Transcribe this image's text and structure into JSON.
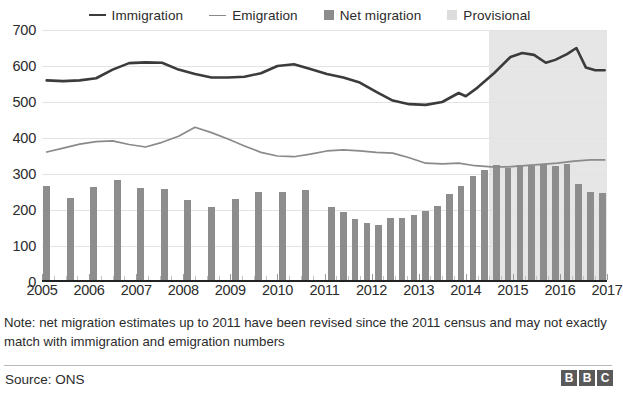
{
  "legend": {
    "items": [
      {
        "label": "Immigration",
        "marker": "line",
        "color": "#3b3b3b",
        "icon": "line-swatch-icon"
      },
      {
        "label": "Emigration",
        "marker": "line",
        "color": "#8a8a8a",
        "icon": "line-swatch-icon"
      },
      {
        "label": "Net migration",
        "marker": "square",
        "color": "#8c8c8c",
        "icon": "square-swatch-icon"
      },
      {
        "label": "Provisional",
        "marker": "square",
        "color": "#dcdcdc",
        "icon": "square-swatch-icon"
      }
    ]
  },
  "note": "Note: net migration estimates up to 2011 have been revised since the 2011 census and may not exactly match with immigration and emigration numbers",
  "footer": {
    "source": "Source: ONS",
    "brand_letters": [
      "B",
      "B",
      "C"
    ]
  },
  "chart_data": {
    "type": "bar",
    "title": "",
    "subtitle": "",
    "xlabel": "",
    "ylabel": "",
    "ylim": [
      0,
      700
    ],
    "yticks": [
      0,
      100,
      200,
      300,
      400,
      500,
      600,
      700
    ],
    "xlim": [
      2005.0,
      2017.0
    ],
    "xticks": [
      2005,
      2006,
      2007,
      2008,
      2009,
      2010,
      2011,
      2012,
      2013,
      2014,
      2015,
      2016,
      2017
    ],
    "grid": true,
    "legend_position": "top-center",
    "units": "thousands",
    "provisional_from": 2014.5,
    "annotations": [
      {
        "text": "Provisional shading begins mid-2014",
        "x": 2014.5
      }
    ],
    "series": [
      {
        "name": "Net migration",
        "type": "bar",
        "color": "#8d8d8d",
        "points": [
          {
            "x": 2005.1,
            "y": 268
          },
          {
            "x": 2005.6,
            "y": 233
          },
          {
            "x": 2006.1,
            "y": 265
          },
          {
            "x": 2006.6,
            "y": 283
          },
          {
            "x": 2007.1,
            "y": 262
          },
          {
            "x": 2007.6,
            "y": 258
          },
          {
            "x": 2008.1,
            "y": 229
          },
          {
            "x": 2008.6,
            "y": 207
          },
          {
            "x": 2009.1,
            "y": 230
          },
          {
            "x": 2009.6,
            "y": 249
          },
          {
            "x": 2010.1,
            "y": 251
          },
          {
            "x": 2010.6,
            "y": 256
          },
          {
            "x": 2011.15,
            "y": 209
          },
          {
            "x": 2011.4,
            "y": 195
          },
          {
            "x": 2011.65,
            "y": 174
          },
          {
            "x": 2011.9,
            "y": 165
          },
          {
            "x": 2012.15,
            "y": 157
          },
          {
            "x": 2012.4,
            "y": 179
          },
          {
            "x": 2012.65,
            "y": 177
          },
          {
            "x": 2012.9,
            "y": 187
          },
          {
            "x": 2013.15,
            "y": 198
          },
          {
            "x": 2013.4,
            "y": 211
          },
          {
            "x": 2013.65,
            "y": 244
          },
          {
            "x": 2013.9,
            "y": 268
          },
          {
            "x": 2014.15,
            "y": 294
          },
          {
            "x": 2014.4,
            "y": 311
          },
          {
            "x": 2014.65,
            "y": 326
          },
          {
            "x": 2014.9,
            "y": 318
          },
          {
            "x": 2015.15,
            "y": 324
          },
          {
            "x": 2015.4,
            "y": 323
          },
          {
            "x": 2015.65,
            "y": 329
          },
          {
            "x": 2015.9,
            "y": 323
          },
          {
            "x": 2016.15,
            "y": 327
          },
          {
            "x": 2016.4,
            "y": 273
          },
          {
            "x": 2016.65,
            "y": 250
          },
          {
            "x": 2016.9,
            "y": 248
          }
        ]
      },
      {
        "name": "Immigration",
        "type": "line",
        "color": "#3b3b3b",
        "points": [
          {
            "x": 2005.1,
            "y": 560
          },
          {
            "x": 2005.45,
            "y": 558
          },
          {
            "x": 2005.8,
            "y": 560
          },
          {
            "x": 2006.15,
            "y": 566
          },
          {
            "x": 2006.5,
            "y": 590
          },
          {
            "x": 2006.85,
            "y": 608
          },
          {
            "x": 2007.2,
            "y": 610
          },
          {
            "x": 2007.55,
            "y": 609
          },
          {
            "x": 2007.9,
            "y": 590
          },
          {
            "x": 2008.25,
            "y": 578
          },
          {
            "x": 2008.6,
            "y": 568
          },
          {
            "x": 2008.95,
            "y": 568
          },
          {
            "x": 2009.3,
            "y": 570
          },
          {
            "x": 2009.65,
            "y": 580
          },
          {
            "x": 2010.0,
            "y": 600
          },
          {
            "x": 2010.35,
            "y": 605
          },
          {
            "x": 2010.7,
            "y": 592
          },
          {
            "x": 2011.05,
            "y": 578
          },
          {
            "x": 2011.4,
            "y": 568
          },
          {
            "x": 2011.75,
            "y": 554
          },
          {
            "x": 2012.1,
            "y": 528
          },
          {
            "x": 2012.45,
            "y": 504
          },
          {
            "x": 2012.8,
            "y": 494
          },
          {
            "x": 2013.15,
            "y": 492
          },
          {
            "x": 2013.5,
            "y": 500
          },
          {
            "x": 2013.85,
            "y": 525
          },
          {
            "x": 2014.0,
            "y": 516
          },
          {
            "x": 2014.25,
            "y": 540
          },
          {
            "x": 2014.6,
            "y": 580
          },
          {
            "x": 2014.95,
            "y": 625
          },
          {
            "x": 2015.2,
            "y": 636
          },
          {
            "x": 2015.45,
            "y": 631
          },
          {
            "x": 2015.7,
            "y": 609
          },
          {
            "x": 2015.9,
            "y": 617
          },
          {
            "x": 2016.15,
            "y": 633
          },
          {
            "x": 2016.35,
            "y": 650
          },
          {
            "x": 2016.55,
            "y": 596
          },
          {
            "x": 2016.75,
            "y": 588
          },
          {
            "x": 2016.95,
            "y": 588
          }
        ]
      },
      {
        "name": "Emigration",
        "type": "line",
        "color": "#8a8a8a",
        "points": [
          {
            "x": 2005.1,
            "y": 361
          },
          {
            "x": 2005.45,
            "y": 372
          },
          {
            "x": 2005.8,
            "y": 383
          },
          {
            "x": 2006.15,
            "y": 390
          },
          {
            "x": 2006.5,
            "y": 392
          },
          {
            "x": 2006.85,
            "y": 382
          },
          {
            "x": 2007.2,
            "y": 375
          },
          {
            "x": 2007.55,
            "y": 388
          },
          {
            "x": 2007.9,
            "y": 405
          },
          {
            "x": 2008.25,
            "y": 430
          },
          {
            "x": 2008.6,
            "y": 415
          },
          {
            "x": 2008.95,
            "y": 397
          },
          {
            "x": 2009.3,
            "y": 378
          },
          {
            "x": 2009.65,
            "y": 360
          },
          {
            "x": 2010.0,
            "y": 350
          },
          {
            "x": 2010.35,
            "y": 348
          },
          {
            "x": 2010.7,
            "y": 355
          },
          {
            "x": 2011.05,
            "y": 364
          },
          {
            "x": 2011.4,
            "y": 367
          },
          {
            "x": 2011.75,
            "y": 364
          },
          {
            "x": 2012.1,
            "y": 360
          },
          {
            "x": 2012.45,
            "y": 358
          },
          {
            "x": 2012.8,
            "y": 345
          },
          {
            "x": 2013.15,
            "y": 330
          },
          {
            "x": 2013.5,
            "y": 328
          },
          {
            "x": 2013.85,
            "y": 330
          },
          {
            "x": 2014.2,
            "y": 323
          },
          {
            "x": 2014.55,
            "y": 320
          },
          {
            "x": 2014.9,
            "y": 320
          },
          {
            "x": 2015.25,
            "y": 323
          },
          {
            "x": 2015.6,
            "y": 327
          },
          {
            "x": 2015.95,
            "y": 330
          },
          {
            "x": 2016.3,
            "y": 336
          },
          {
            "x": 2016.65,
            "y": 339
          },
          {
            "x": 2016.95,
            "y": 339
          }
        ]
      }
    ]
  }
}
